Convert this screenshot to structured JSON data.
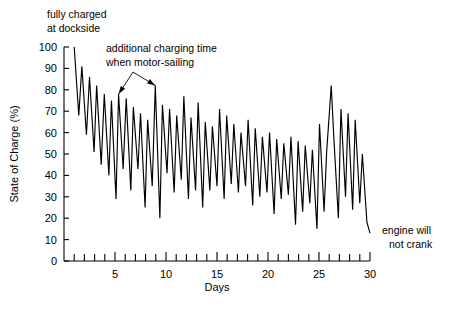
{
  "chart_data": {
    "type": "line",
    "title": "",
    "subtitle": "",
    "xlabel": "Days",
    "ylabel": "State of Charge (%)",
    "xlim": [
      0,
      30
    ],
    "ylim": [
      0,
      100
    ],
    "grid": false,
    "legend": "none",
    "x_ticks_major": [
      5,
      10,
      15,
      20,
      25,
      30
    ],
    "x_ticks_major_labels": [
      "5",
      "10",
      "15",
      "20",
      "25",
      "30"
    ],
    "x_ticks_minor": [
      1,
      2,
      3,
      4,
      6,
      7,
      8,
      9,
      11,
      12,
      13,
      14,
      16,
      17,
      18,
      19,
      21,
      22,
      23,
      24,
      26,
      27,
      28,
      29
    ],
    "y_ticks": [
      0,
      10,
      20,
      30,
      40,
      50,
      60,
      70,
      80,
      90,
      100
    ],
    "y_tick_labels": [
      "0",
      "10",
      "20",
      "30",
      "40",
      "50",
      "60",
      "70",
      "80",
      "90",
      "100"
    ],
    "series": [
      {
        "name": "State of Charge",
        "color": "#000000",
        "x": [
          1.0,
          1.45,
          1.75,
          2.2,
          2.5,
          2.95,
          3.2,
          3.65,
          3.95,
          4.4,
          4.65,
          5.1,
          5.35,
          5.8,
          6.1,
          6.55,
          6.8,
          7.25,
          7.5,
          7.95,
          8.2,
          8.65,
          8.95,
          9.4,
          9.65,
          10.1,
          10.35,
          10.8,
          11.05,
          11.5,
          11.75,
          12.2,
          12.45,
          12.9,
          13.15,
          13.6,
          13.85,
          14.3,
          14.55,
          15.0,
          15.25,
          15.7,
          15.95,
          16.4,
          16.65,
          17.1,
          17.35,
          17.8,
          18.05,
          18.5,
          18.75,
          19.2,
          19.45,
          19.9,
          20.15,
          20.6,
          20.85,
          21.3,
          21.55,
          22.0,
          22.25,
          22.7,
          22.95,
          23.4,
          23.65,
          24.1,
          24.35,
          24.8,
          25.05,
          25.5,
          25.75,
          26.2,
          26.45,
          26.9,
          27.15,
          27.6,
          27.85,
          28.3,
          28.55,
          29.0,
          29.25,
          29.7,
          30.0
        ],
        "y": [
          100,
          68,
          91,
          59,
          86,
          51,
          82,
          45,
          78,
          40,
          75,
          29,
          78,
          43,
          76,
          33,
          72,
          43,
          69,
          25,
          66,
          35,
          82,
          20,
          73,
          41,
          71,
          32,
          68,
          38,
          77,
          29,
          67,
          33,
          74,
          25,
          65,
          33,
          63,
          35,
          71,
          29,
          68,
          36,
          64,
          32,
          60,
          35,
          66,
          26,
          62,
          30,
          58,
          32,
          60,
          22,
          57,
          29,
          55,
          31,
          58,
          17,
          56,
          23,
          54,
          27,
          52,
          15,
          64,
          23,
          51,
          82,
          58,
          20,
          71,
          30,
          69,
          24,
          66,
          27,
          50,
          18,
          13
        ]
      }
    ],
    "annotations": [
      {
        "id": "fully-charged",
        "text_lines": [
          "fully charged",
          "at dockside"
        ],
        "points_to": {
          "x": 1.0,
          "y": 100
        }
      },
      {
        "id": "additional-charging",
        "text_lines": [
          "additional charging time",
          "when motor-sailing"
        ],
        "points_to": [
          {
            "x": 5.35,
            "y": 78
          },
          {
            "x": 8.95,
            "y": 82
          }
        ]
      },
      {
        "id": "engine-will-not-crank",
        "text_lines": [
          "engine will",
          "not crank"
        ],
        "points_to": {
          "x": 30.0,
          "y": 13
        }
      }
    ]
  },
  "axis": {
    "y_label": "State of Charge (%)",
    "x_label": "Days"
  }
}
